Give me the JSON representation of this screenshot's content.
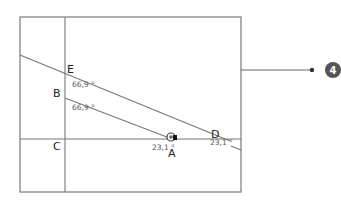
{
  "diagram": {
    "points": {
      "A": "A",
      "B": "B",
      "C": "C",
      "D": "D",
      "E": "E"
    },
    "angles": {
      "at_E": "66,9 °",
      "at_B": "66,9 °",
      "at_A": "23,1 °",
      "at_D": "23,1 °"
    },
    "callout": {
      "number": "4"
    },
    "colors": {
      "lines": "#777777",
      "badge": "#555555"
    }
  }
}
